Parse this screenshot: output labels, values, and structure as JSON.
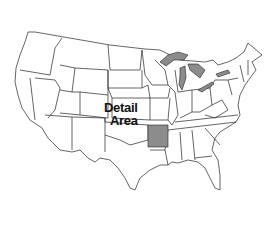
{
  "map": {
    "title": "Contiguous United States",
    "label_line1": "Detail",
    "label_line2": "Area",
    "highlighted_state": "Arkansas",
    "highlight_color": "#8c8c8c",
    "lakes_color": "#8c8c8c",
    "outline_color": "#222222",
    "fill_color": "#ffffff"
  }
}
